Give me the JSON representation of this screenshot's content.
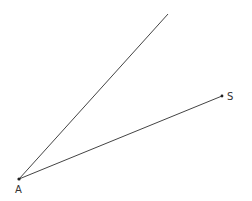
{
  "diagram": {
    "type": "angle",
    "points": {
      "A": {
        "label": "A",
        "x": 19,
        "y": 179
      },
      "S": {
        "label": "S",
        "x": 222,
        "y": 96
      }
    },
    "rays": [
      {
        "from": "A",
        "to": {
          "x": 168,
          "y": 14
        }
      },
      {
        "from": "A",
        "through": "S"
      }
    ],
    "line_color": "#333333"
  }
}
